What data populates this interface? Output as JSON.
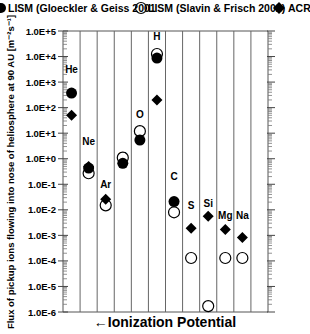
{
  "chart_data": {
    "type": "scatter",
    "title": "",
    "legend": [
      {
        "name": "LISM (Gloeckler & Geiss 2001",
        "marker": "filled-circle"
      },
      {
        "name": "LISM (Slavin & Frisch 2002)",
        "marker": "open-circle"
      },
      {
        "name": "ACR's",
        "marker": "filled-diamond"
      }
    ],
    "xlabel": "←Ionization Potential",
    "ylabel": "Flux of pickup ions flowing into nose of heliosphere at 90 AU [m⁻²s⁻¹]",
    "yscale": "log",
    "ylim": [
      1e-06,
      100000.0
    ],
    "ytick_labels": [
      "1.0E+5",
      "1.0E+4",
      "1.0E+3",
      "1.0E+2",
      "1.0E+1",
      "1.0E+0",
      "1.0E-1",
      "1.0E-2",
      "1.0E-3",
      "1.0E-4",
      "1.0E-5",
      "1.0E-6"
    ],
    "categories": [
      "He",
      "Ne",
      "Ar",
      "N",
      "O",
      "H",
      "C",
      "S",
      "Si",
      "Mg",
      "Na",
      ""
    ],
    "series": [
      {
        "name": "LISM (Gloeckler & Geiss 2001",
        "values": [
          370,
          0.43,
          null,
          0.66,
          5.4,
          8700,
          0.021,
          null,
          null,
          null,
          null,
          null
        ]
      },
      {
        "name": "LISM (Slavin & Frisch 2002)",
        "values": [
          null,
          0.27,
          0.015,
          1.1,
          12,
          12600,
          0.008,
          0.00013,
          1.7e-06,
          0.00013,
          0.00013,
          null
        ]
      },
      {
        "name": "ACR's",
        "values": [
          50,
          0.5,
          0.026,
          null,
          null,
          200,
          null,
          0.0019,
          0.0056,
          0.0017,
          0.00083,
          null
        ]
      }
    ],
    "grid": "vertical lines separating categories",
    "legend_position": "top"
  },
  "legend_labels": {
    "gloeckler": "LISM  (Gloeckler & Geiss 2001",
    "slavin": "LISM (Slavin & Frisch 2002)",
    "acr": "ACR's"
  },
  "axis": {
    "xlabel": "←Ionization Potential",
    "ylabel": "Flux of pickup ions flowing into nose of heliosphere at 90 AU [m⁻²s⁻¹]"
  }
}
